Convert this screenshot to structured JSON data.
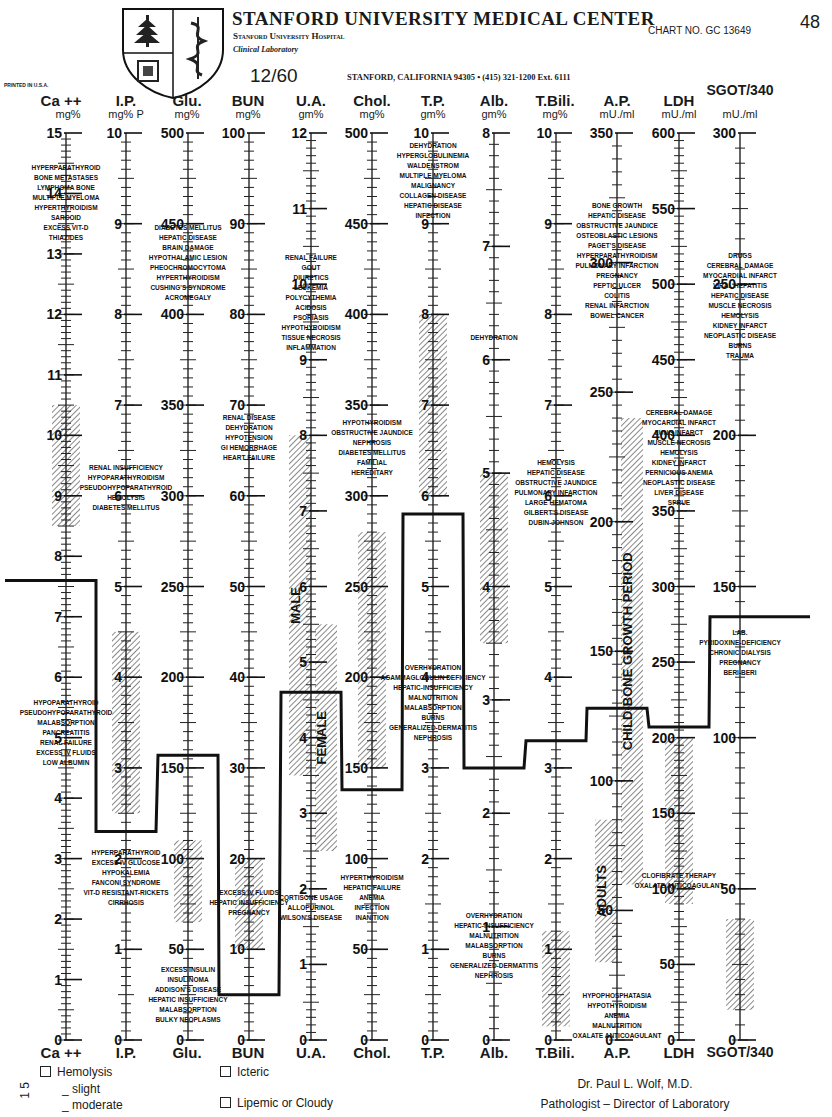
{
  "header": {
    "title": "STANFORD UNIVERSITY MEDICAL CENTER",
    "hospital": "Stanford University Hospital",
    "department": "Clinical Laboratory",
    "chart_no": "CHART NO. GC 13649",
    "page_number": "48",
    "date": "12/60",
    "address": "STANFORD, CALIFORNIA 94305 • (415) 321-1200 Ext. 6111",
    "printed": "PRINTED IN U.S.A."
  },
  "footer": {
    "checkboxes": [
      {
        "label": "Hemolysis",
        "checked": false
      },
      {
        "label": "Icteric",
        "checked": false
      },
      {
        "label": "Lipemic or Cloudy",
        "checked": false
      }
    ],
    "hemolysis_levels": [
      "_ slight",
      "_ moderate"
    ],
    "margin_note": "1 5",
    "signature_name": "Dr. Paul L. Wolf, M.D.",
    "signature_title": "Pathologist – Director of Laboratory"
  },
  "chart_data": {
    "type": "line",
    "layout": {
      "axes": "12 parallel vertical scales",
      "grid": false,
      "legend": "none",
      "normal_range": "white band; abnormal ranges hatched"
    },
    "columns": [
      {
        "key": "ca",
        "label": "Ca ++",
        "unit": "mg%",
        "max": 15,
        "ticks": [
          0,
          1,
          2,
          3,
          4,
          5,
          6,
          7,
          8,
          9,
          10,
          11,
          12,
          13,
          14,
          15
        ],
        "patient_value": 7.6,
        "hatched": [
          [
            8.5,
            10.5
          ]
        ],
        "high_causes": [
          "HYPERPARATHYROID",
          "BONE METASTASES",
          "LYMPHOMA BONE",
          "MULTIPLE MYELOMA",
          "HYPERTHYROIDISM",
          "SARCOID",
          "EXCESS VIT-D",
          "THIAZIDES"
        ],
        "low_causes": [
          "HYPOPARATHYROID",
          "PSEUDOHYPOPARATHYROID",
          "MALABSORPTION",
          "PANCREATITIS",
          "RENAL FAILURE",
          "EXCESS IV FLUIDS",
          "LOW ALBUMIN"
        ]
      },
      {
        "key": "ip",
        "label": "I.P.",
        "unit": "mg% P",
        "max": 10,
        "ticks": [
          0,
          1,
          2,
          3,
          4,
          5,
          6,
          7,
          8,
          9,
          10
        ],
        "patient_value": 2.3,
        "hatched": [
          [
            2.5,
            4.5
          ]
        ],
        "high_causes": [
          "RENAL INSUFFICIENCY",
          "HYPOPARATHYROIDISM",
          "PSEUDOHYPOPARATHYROID",
          "HEMOLYSIS",
          "DIABETES MELLITUS"
        ],
        "low_causes": [
          "HYPERPARATHYROID",
          "EXCESS IV GLUCOSE",
          "HYPOKALEMIA",
          "FANCONI SYNDROME",
          "VIT-D RESISTANT-RICKETS",
          "CIRRHOSIS"
        ]
      },
      {
        "key": "glu",
        "label": "Glu.",
        "unit": "mg%",
        "max": 500,
        "ticks": [
          0,
          50,
          100,
          150,
          200,
          250,
          300,
          350,
          400,
          450,
          500
        ],
        "patient_value": 157,
        "hatched": [
          [
            65,
            110
          ]
        ],
        "high_causes": [
          "DIABETES MELLITUS",
          "HEPATIC DISEASE",
          "BRAIN DAMAGE",
          "HYPOTHALAMIC LESION",
          "PHEOCHROMOCYTOMA",
          "HYPERTHYROIDISM",
          "CUSHING'S SYNDROME",
          "ACROMEGALY"
        ],
        "low_causes": [
          "EXCESS INSULIN",
          "INSULINOMA",
          "ADDISON'S DISEASE",
          "HEPATIC INSUFFICIENCY",
          "MALABSORPTION",
          "BULKY NEOPLASMS"
        ]
      },
      {
        "key": "bun",
        "label": "BUN",
        "unit": "mg%",
        "max": 100,
        "ticks": [
          0,
          10,
          20,
          30,
          40,
          50,
          60,
          70,
          80,
          90,
          100
        ],
        "patient_value": 5,
        "hatched": [
          [
            10,
            20
          ]
        ],
        "high_causes": [
          "RENAL DISEASE",
          "DEHYDRATION",
          "HYPOTENSION",
          "GI HEMORRHAGE",
          "HEART FAILURE"
        ],
        "low_causes": [
          "EXCESS IV FLUIDS",
          "HEPATIC INSUFFICIENCY",
          "PREGNANCY"
        ]
      },
      {
        "key": "ua",
        "label": "U.A.",
        "unit": "gm%",
        "max": 12,
        "ticks": [
          0,
          1,
          2,
          3,
          4,
          5,
          6,
          7,
          8,
          9,
          10,
          11,
          12
        ],
        "patient_value": 4.6,
        "hatched": [
          [
            3.5,
            8.0
          ],
          [
            2.5,
            5.5
          ]
        ],
        "band_labels": [
          "MALE",
          "FEMALE"
        ],
        "high_causes": [
          "RENAL FAILURE",
          "GOUT",
          "DIURETICS",
          "LEUKEMIA",
          "POLYCYTHEMIA",
          "ACIDOSIS",
          "PSORIASIS",
          "HYPOTHYROIDISM",
          "TISSUE NECROSIS",
          "INFLAMMATION"
        ],
        "low_causes": [
          "CORTISONE USAGE",
          "ALLOPURINOL",
          "WILSON'S DISEASE"
        ]
      },
      {
        "key": "chol",
        "label": "Chol.",
        "unit": "mg%",
        "max": 500,
        "ticks": [
          0,
          50,
          100,
          150,
          200,
          250,
          300,
          350,
          400,
          450,
          500
        ],
        "patient_value": 138,
        "hatched": [
          [
            150,
            280
          ]
        ],
        "high_causes": [
          "HYPOTHYROIDISM",
          "OBSTRUCTIVE JAUNDICE",
          "NEPHROSIS",
          "DIABETES MELLITUS",
          "FAMILIAL",
          "HEREDITARY"
        ],
        "low_causes": [
          "HYPERTHYROIDISM",
          "HEPATIC FAILURE",
          "ANEMIA",
          "INFECTION",
          "INANITION"
        ]
      },
      {
        "key": "tp",
        "label": "T.P.",
        "unit": "gm%",
        "max": 10,
        "ticks": [
          0,
          1,
          2,
          3,
          4,
          5,
          6,
          7,
          8,
          9,
          10
        ],
        "patient_value": 5.8,
        "hatched": [
          [
            6.0,
            8.0
          ]
        ],
        "high_causes": [
          "DEHYDRATION",
          "HYPERGLOBULINEMIA",
          "WALDENSTROM",
          "MULTIPLE MYELOMA",
          "MALIGNANCY",
          "COLLAGEN DISEASE",
          "HEPATIC DISEASE",
          "INFECTION"
        ],
        "low_causes": [
          "OVERHYDRATION",
          "AGAMMAGLOBULIN DEFICIENCY",
          "HEPATIC-INSUFFICIENCY",
          "MALNUTRITION",
          "MALABSORPTION",
          "BURNS",
          "GENERALIZED-DERMATITIS",
          "NEPHROSIS"
        ]
      },
      {
        "key": "alb",
        "label": "Alb.",
        "unit": "gm%",
        "max": 8,
        "ticks": [
          0,
          1,
          2,
          3,
          4,
          5,
          6,
          7,
          8
        ],
        "patient_value": 2.4,
        "hatched": [
          [
            3.5,
            5.0
          ]
        ],
        "high_causes": [
          "DEHYDRATION"
        ],
        "low_causes": [
          "OVERHYDRATION",
          "HEPATIC-INSUFFICIENCY",
          "MALNUTRITION",
          "MALABSORPTION",
          "BURNS",
          "GENERALIZED-DERMATITIS",
          "NEPHROSIS"
        ]
      },
      {
        "key": "tbili",
        "label": "T.Bili.",
        "unit": "mg%",
        "max": 10,
        "ticks": [
          0,
          1,
          2,
          3,
          4,
          5,
          6,
          7,
          8,
          9,
          10
        ],
        "patient_value": 3.3,
        "hatched": [
          [
            0.15,
            1.2
          ]
        ],
        "high_causes": [
          "HEMOLYSIS",
          "HEPATIC DISEASE",
          "OBSTRUCTIVE JAUNDICE",
          "PULMONARY INFARCTION",
          "LARGE HEMATOMA",
          "GILBERT'S DISEASE",
          "DUBIN-JOHNSON"
        ],
        "low_causes": []
      },
      {
        "key": "ap",
        "label": "A.P.",
        "unit": "mU./ml",
        "max": 350,
        "ticks": [
          0,
          50,
          100,
          150,
          200,
          250,
          300,
          350
        ],
        "patient_value": 128,
        "hatched": [
          [
            30,
            85
          ],
          [
            60,
            240
          ]
        ],
        "band_labels": [
          "ADULTS",
          "CHILD-BONE GROWTH PERIOD"
        ],
        "high_causes": [
          "BONE GROWTH",
          "HEPATIC DISEASE",
          "OBSTRUCTIVE JAUNDICE",
          "OSTEOBLASTIC LESIONS",
          "PAGET'S DISEASE",
          "HYPERPARATHYROIDISM",
          "PULMONARY INFARCTION",
          "PREGNANCY",
          "PEPTIC ULCER",
          "COLITIS",
          "RENAL INFARCTION",
          "BOWEL CANCER"
        ],
        "low_causes": [
          "HYPOPHOSPHATASIA",
          "HYPOTHYROIDISM",
          "ANEMIA",
          "MALNUTRITION",
          "OXALATE ANTICOAGULANT"
        ]
      },
      {
        "key": "ldh",
        "label": "LDH",
        "unit": "mU./ml",
        "max": 600,
        "ticks": [
          0,
          50,
          100,
          150,
          200,
          250,
          300,
          350,
          400,
          450,
          500,
          550,
          600
        ],
        "patient_value": 207,
        "hatched": [
          [
            90,
            200
          ]
        ],
        "high_causes": [
          "CEREBRAL DAMAGE",
          "MYOCARDIAL INFARCT",
          "LUNG INFARCT",
          "MUSCLE NECROSIS",
          "HEMOLYSIS",
          "KIDNEY INFARCT",
          "PERNICIOUS ANEMIA",
          "NEOPLASTIC DISEASE",
          "LIVER DISEASE",
          "SPRUE"
        ],
        "low_causes": [
          "CLOFIBRATE THERAPY",
          "OXALATE ANTICOAGULANT"
        ]
      },
      {
        "key": "sgot",
        "label": "SGOT/340",
        "unit": "mU./ml",
        "max": 300,
        "ticks": [
          0,
          50,
          100,
          150,
          200,
          250,
          300
        ],
        "patient_value": 140,
        "hatched": [
          [
            10,
            40
          ]
        ],
        "high_causes": [
          "DRUGS",
          "CEREBRAL DAMAGE",
          "MYOCARDIAL INFARCT",
          "VIRAL HEPATITIS",
          "HEPATIC DISEASE",
          "MUSCLE NECROSIS",
          "HEMOLYSIS",
          "KIDNEY INFARCT",
          "NEOPLASTIC DISEASE",
          "BURNS",
          "TRAUMA"
        ],
        "low_causes": [
          "LAB.",
          "PYRIDOXINE-DEFICIENCY",
          "CHRONIC DIALYSIS",
          "PREGNANCY",
          "BERI-BERI"
        ]
      }
    ]
  }
}
